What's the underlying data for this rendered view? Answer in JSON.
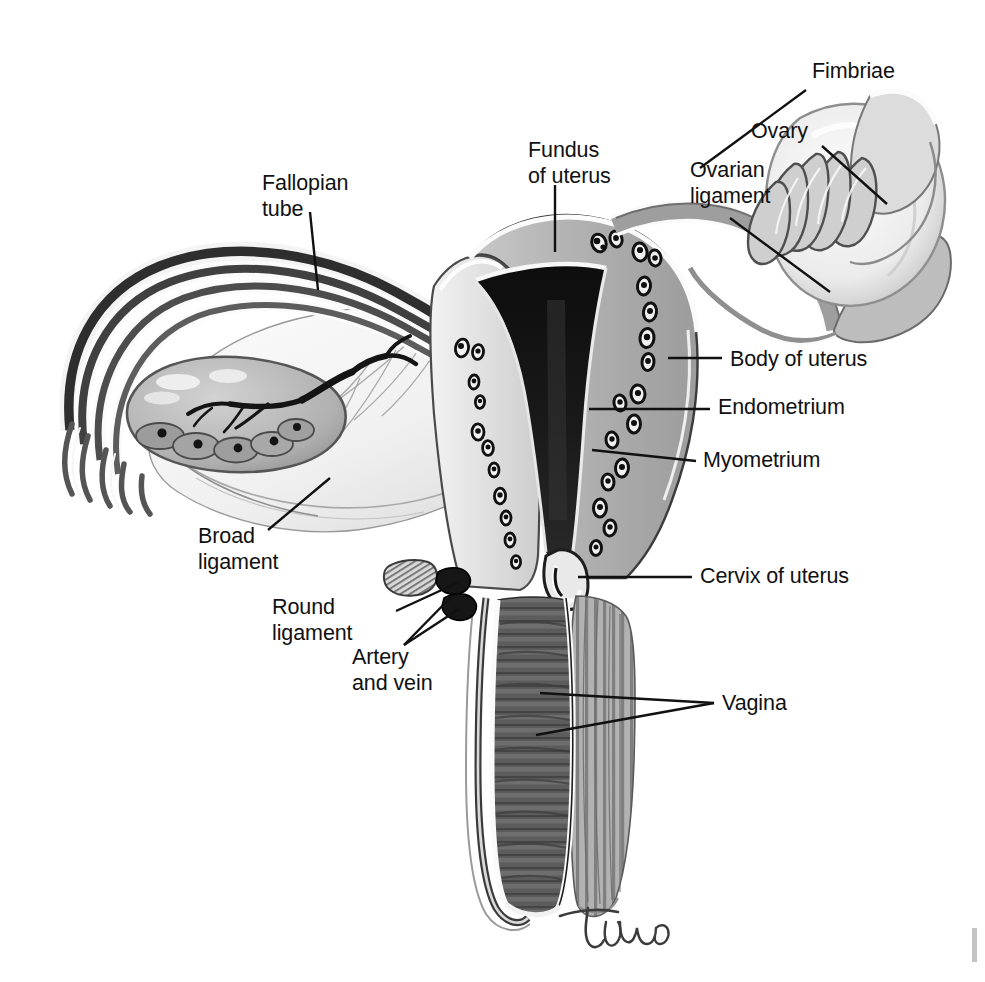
{
  "figure": {
    "background_color": "#ffffff",
    "ink_color": "#111111",
    "signature": "Tina",
    "width": 985,
    "height": 982
  },
  "labels": [
    {
      "id": "fimbriae",
      "name": "fimbriae",
      "lines": [
        "Fimbriae"
      ],
      "text_x": 812,
      "text_y": 78,
      "anchor": "start",
      "leader": [
        [
          806,
          90
        ],
        [
          700,
          168
        ]
      ]
    },
    {
      "id": "ovary",
      "name": "ovary",
      "lines": [
        "Ovary"
      ],
      "text_x": 751,
      "text_y": 138,
      "anchor": "start",
      "leader": [
        [
          822,
          146
        ],
        [
          887,
          204
        ]
      ]
    },
    {
      "id": "ovarian-ligament",
      "name": "ovarian-ligament",
      "lines": [
        "Ovarian",
        "ligament"
      ],
      "text_x": 690,
      "text_y": 177,
      "anchor": "start",
      "leader": [
        [
          730,
          218
        ],
        [
          830,
          292
        ]
      ]
    },
    {
      "id": "fundus-of-uterus",
      "name": "fundus-of-uterus",
      "lines": [
        "Fundus",
        "of uterus"
      ],
      "text_x": 528,
      "text_y": 157,
      "anchor": "start",
      "leader": [
        [
          555,
          185
        ],
        [
          555,
          252
        ]
      ]
    },
    {
      "id": "fallopian-tube",
      "name": "fallopian-tube",
      "lines": [
        "Fallopian",
        "tube"
      ],
      "text_x": 262,
      "text_y": 190,
      "anchor": "start",
      "leader": [
        [
          310,
          212
        ],
        [
          318,
          290
        ]
      ]
    },
    {
      "id": "body-of-uterus",
      "name": "body-of-uterus",
      "lines": [
        "Body of uterus"
      ],
      "text_x": 730,
      "text_y": 366,
      "anchor": "start",
      "leader": [
        [
          668,
          358
        ],
        [
          722,
          358
        ]
      ]
    },
    {
      "id": "endometrium",
      "name": "endometrium",
      "lines": [
        "Endometrium"
      ],
      "text_x": 718,
      "text_y": 414,
      "anchor": "start",
      "leader": [
        [
          589,
          409
        ],
        [
          710,
          409
        ]
      ]
    },
    {
      "id": "myometrium",
      "name": "myometrium",
      "lines": [
        "Myometrium"
      ],
      "text_x": 703,
      "text_y": 467,
      "anchor": "start",
      "leader": [
        [
          592,
          450
        ],
        [
          696,
          461
        ]
      ]
    },
    {
      "id": "broad-ligament",
      "name": "broad-ligament",
      "lines": [
        "Broad",
        "ligament"
      ],
      "text_x": 198,
      "text_y": 543,
      "anchor": "start",
      "leader": [
        [
          268,
          530
        ],
        [
          330,
          478
        ]
      ]
    },
    {
      "id": "cervix-of-uterus",
      "name": "cervix-of-uterus",
      "lines": [
        "Cervix of uterus"
      ],
      "text_x": 700,
      "text_y": 583,
      "anchor": "start",
      "leader": [
        [
          578,
          577
        ],
        [
          692,
          577
        ]
      ]
    },
    {
      "id": "round-ligament",
      "name": "round-ligament",
      "lines": [
        "Round",
        "ligament"
      ],
      "text_x": 272,
      "text_y": 614,
      "anchor": "start",
      "leader": [
        [
          396,
          611
        ],
        [
          457,
          583
        ]
      ]
    },
    {
      "id": "artery-and-vein",
      "name": "artery-and-vein",
      "lines": [
        "Artery",
        "and vein"
      ],
      "text_x": 352,
      "text_y": 664,
      "anchor": "start",
      "leader": [
        [
          404,
          645
        ],
        [
          452,
          596
        ]
      ],
      "leader2": [
        [
          404,
          645
        ],
        [
          459,
          609
        ]
      ]
    },
    {
      "id": "vagina",
      "name": "vagina",
      "lines": [
        "Vagina"
      ],
      "text_x": 722,
      "text_y": 710,
      "anchor": "start",
      "leader": [
        [
          540,
          693
        ],
        [
          714,
          703
        ]
      ],
      "leader2": [
        [
          536,
          735
        ],
        [
          714,
          703
        ]
      ]
    }
  ],
  "structures": [
    {
      "name": "right-ovary",
      "description": "Ovary at upper right shown whole with fimbriae draping over it"
    },
    {
      "name": "left-ovary",
      "description": "Ovary at left shown in section with follicles"
    },
    {
      "name": "left-fallopian-tube",
      "description": "Coiled fallopian tube arcing from uterus to left fimbriae"
    },
    {
      "name": "uterine-cavity",
      "description": "Dark triangular endometrial cavity in centre of uterus"
    },
    {
      "name": "myometrium-wall",
      "description": "Thick muscular uterine wall with blood vessel cross-sections"
    },
    {
      "name": "broad-ligament-sheet",
      "description": "Pale membranous sheet spreading left from uterus"
    },
    {
      "name": "cervical-canal",
      "description": "Narrow canal connecting uterine cavity to vagina"
    },
    {
      "name": "vaginal-canal",
      "description": "Dark rugose vaginal lumen descending below cervix"
    },
    {
      "name": "vaginal-wall",
      "description": "Striated muscular vaginal wall"
    }
  ]
}
